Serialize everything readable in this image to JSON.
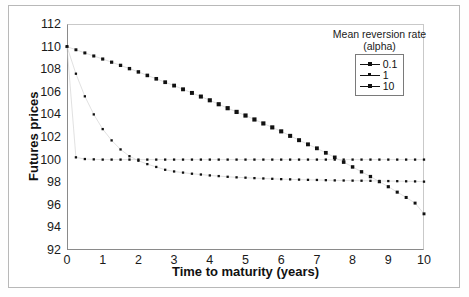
{
  "chart_data": {
    "type": "scatter",
    "title": "",
    "xlabel": "Time to maturity (years)",
    "ylabel": "Futures prices",
    "xlim": [
      0,
      10
    ],
    "ylim": [
      92,
      112
    ],
    "xticks": [
      0,
      1,
      2,
      3,
      4,
      5,
      6,
      7,
      8,
      9,
      10
    ],
    "yticks": [
      92,
      94,
      96,
      98,
      100,
      102,
      104,
      106,
      108,
      110,
      112
    ],
    "grid": false,
    "legend_position": "top-right",
    "legend_title": "Mean reversion rate",
    "legend_subtitle": "(alpha)",
    "series": [
      {
        "name": "0.1",
        "marker": "square-large",
        "x": [
          0,
          0.25,
          0.5,
          0.75,
          1,
          1.25,
          1.5,
          1.75,
          2,
          2.25,
          2.5,
          2.75,
          3,
          3.25,
          3.5,
          3.75,
          4,
          4.25,
          4.5,
          4.75,
          5,
          5.25,
          5.5,
          5.75,
          6,
          6.25,
          6.5,
          6.75,
          7,
          7.25,
          7.5,
          7.75,
          8,
          8.25,
          8.5,
          8.75,
          9,
          9.25,
          9.5,
          9.75,
          10
        ],
        "values": [
          110,
          109.72,
          109.44,
          109.17,
          108.9,
          108.62,
          108.34,
          108.05,
          107.76,
          107.45,
          107.15,
          106.85,
          106.55,
          106.22,
          105.9,
          105.58,
          105.25,
          104.9,
          104.55,
          104.22,
          103.9,
          103.55,
          103.2,
          102.85,
          102.5,
          102.1,
          101.72,
          101.35,
          101,
          100.6,
          100.2,
          99.78,
          99.35,
          98.92,
          98.5,
          98.05,
          97.6,
          97.12,
          96.65,
          96.15,
          95.2
        ]
      },
      {
        "name": "1",
        "marker": "square-small",
        "x": [
          0,
          0.25,
          0.5,
          0.75,
          1,
          1.25,
          1.5,
          1.75,
          2,
          2.25,
          2.5,
          2.75,
          3,
          3.25,
          3.5,
          3.75,
          4,
          4.25,
          4.5,
          4.75,
          5,
          5.25,
          5.5,
          5.75,
          6,
          6.25,
          6.5,
          6.75,
          7,
          7.25,
          7.5,
          7.75,
          8,
          8.25,
          8.5,
          8.75,
          9,
          9.25,
          9.5,
          9.75,
          10
        ],
        "values": [
          110,
          107.6,
          105.6,
          104,
          102.7,
          101.7,
          100.9,
          100.3,
          99.9,
          99.6,
          99.35,
          99.1,
          98.95,
          98.85,
          98.75,
          98.68,
          98.6,
          98.54,
          98.48,
          98.43,
          98.4,
          98.36,
          98.33,
          98.3,
          98.27,
          98.25,
          98.23,
          98.21,
          98.2,
          98.18,
          98.16,
          98.15,
          98.14,
          98.13,
          98.12,
          98.11,
          98.1,
          98.09,
          98.08,
          98.07,
          98.05
        ]
      },
      {
        "name": "10",
        "marker": "square-small",
        "x": [
          0,
          0.25,
          0.5,
          0.75,
          1,
          1.25,
          1.5,
          1.75,
          2,
          2.25,
          2.5,
          2.75,
          3,
          3.25,
          3.5,
          3.75,
          4,
          4.25,
          4.5,
          4.75,
          5,
          5.25,
          5.5,
          5.75,
          6,
          6.25,
          6.5,
          6.75,
          7,
          7.25,
          7.5,
          7.75,
          8,
          8.25,
          8.5,
          8.75,
          9,
          9.25,
          9.5,
          9.75,
          10
        ],
        "values": [
          110,
          100.2,
          100.05,
          100.02,
          100,
          100,
          100,
          100,
          100,
          100,
          100,
          100,
          100,
          100,
          100,
          100,
          100,
          100,
          100,
          100,
          100,
          100,
          100,
          100,
          100,
          100,
          100,
          100,
          100,
          100,
          100,
          100,
          100,
          100,
          100,
          100,
          100,
          100,
          100,
          100,
          100
        ]
      }
    ],
    "colors": {
      "series": "#111111",
      "axis": "#8a8a8a",
      "frame": "#b8b8b8",
      "text": "#1a1a1a"
    }
  }
}
